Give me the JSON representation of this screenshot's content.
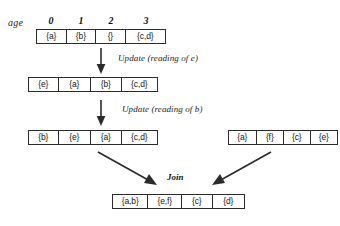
{
  "diagram": {
    "age_label": "age",
    "column_headers": [
      "0",
      "1",
      "2",
      "3"
    ],
    "rows": {
      "initial": {
        "cells": [
          "{a}",
          "{b}",
          "{}",
          "{c,d}"
        ]
      },
      "after_update_e": {
        "cells": [
          "{e}",
          "{a}",
          "{b}",
          "{c,d}"
        ]
      },
      "after_update_b": {
        "cells": [
          "{b}",
          "{e}",
          "{a}",
          "{c,d}"
        ]
      },
      "other_replica": {
        "cells": [
          "{a}",
          "{f}",
          "{c}",
          "{e}"
        ]
      },
      "joined": {
        "cells": [
          "{a,b}",
          "{e,f}",
          "{c}",
          "{d}"
        ]
      }
    },
    "captions": {
      "update_e": "Update (reading of e)",
      "update_b": "Update (reading of b)",
      "join": "Join"
    },
    "colors": {
      "stroke": "#2b2b2b",
      "text": "#141414",
      "background": "#ffffff"
    }
  }
}
